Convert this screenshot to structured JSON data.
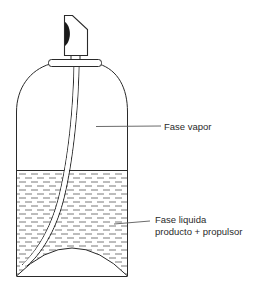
{
  "diagram": {
    "labels": {
      "vapor_phase": "Fase vapor",
      "liquid_phase_line1": "Fase liquida",
      "liquid_phase_line2": "producto + propulsor"
    },
    "parts": [
      "nozzle",
      "valve-cap",
      "dip-tube",
      "can-body",
      "vapor-phase",
      "liquid-phase",
      "domed-bottom"
    ],
    "colors": {
      "ink": "#2a2a2a",
      "hatch": "#6a6a6a",
      "background": "#ffffff"
    }
  }
}
